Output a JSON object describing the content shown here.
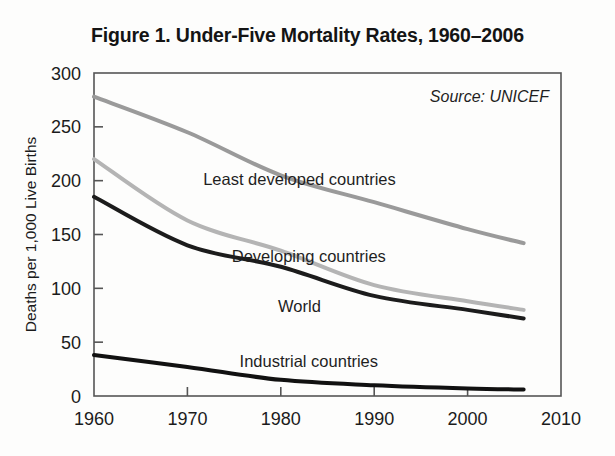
{
  "figure": {
    "title": "Figure 1. Under-Five Mortality Rates, 1960–2006",
    "source_note": "Source: UNICEF",
    "background_color": "#fdfdfc",
    "frame_color": "#555555"
  },
  "chart_data": {
    "type": "line",
    "title": "Figure 1. Under-Five Mortality Rates, 1960–2006",
    "xlabel": "",
    "ylabel": "Deaths per 1,000 Live Births",
    "xlim": [
      1960,
      2010
    ],
    "ylim": [
      0,
      300
    ],
    "xticks": [
      1960,
      1970,
      1980,
      1990,
      2000,
      2010
    ],
    "yticks": [
      0,
      50,
      100,
      150,
      200,
      250,
      300
    ],
    "xtick_labels": [
      "1960",
      "1970",
      "1980",
      "1990",
      "2000",
      "2010"
    ],
    "ytick_labels": [
      "0",
      "50",
      "100",
      "150",
      "200",
      "250",
      "300"
    ],
    "grid": false,
    "legend": "inline-labels",
    "annotations": [
      "Source: UNICEF"
    ],
    "x": [
      1960,
      1970,
      1980,
      1990,
      2000,
      2006
    ],
    "series": [
      {
        "name": "Least developed countries",
        "color": "#9a9a9a",
        "width": 4.0,
        "values": [
          278,
          245,
          205,
          180,
          155,
          142
        ],
        "label_x": 1982,
        "label_y": 196
      },
      {
        "name": "Developing countries",
        "color": "#b4b4b4",
        "width": 4.0,
        "values": [
          220,
          163,
          135,
          103,
          88,
          80
        ],
        "label_x": 1983,
        "label_y": 124
      },
      {
        "name": "World",
        "color": "#1c1c1c",
        "width": 4.0,
        "values": [
          185,
          140,
          120,
          93,
          80,
          72
        ],
        "label_x": 1982,
        "label_y": 78
      },
      {
        "name": "Industrial countries",
        "color": "#111111",
        "width": 4.0,
        "values": [
          38,
          27,
          15,
          10,
          7,
          6
        ],
        "label_x": 1983,
        "label_y": 27
      }
    ]
  }
}
